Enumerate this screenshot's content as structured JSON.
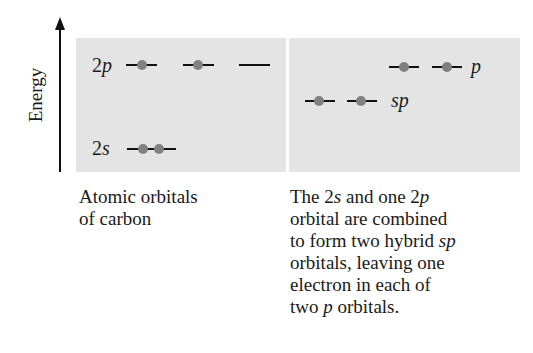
{
  "axis": {
    "label": "Energy"
  },
  "left_panel": {
    "levels": [
      {
        "name": "2p",
        "prefix": "2",
        "italic": "p",
        "orbitals": 3,
        "electrons": [
          1,
          1,
          0
        ]
      },
      {
        "name": "2s",
        "prefix": "2",
        "italic": "s",
        "orbitals": 1,
        "electrons": [
          2
        ]
      }
    ],
    "caption_lines": [
      "Atomic orbitals",
      "of carbon"
    ]
  },
  "right_panel": {
    "levels": [
      {
        "name": "p",
        "italic": "p",
        "orbitals": 2,
        "electrons": [
          1,
          1
        ]
      },
      {
        "name": "sp",
        "italic": "sp",
        "orbitals": 2,
        "electrons": [
          1,
          1
        ]
      }
    ],
    "caption": {
      "line1_a": "The 2",
      "line1_s": "s",
      "line1_b": " and one 2",
      "line1_p": "p",
      "line2": "orbital are combined",
      "line3_a": "to form two hybrid ",
      "line3_sp": "sp",
      "line4": "orbitals, leaving one",
      "line5": "electron in each of",
      "line6_a": "two ",
      "line6_p": "p",
      "line6_b": " orbitals."
    }
  },
  "colors": {
    "panel": "#e4e4e4",
    "electron": "#808080",
    "line": "#111111"
  }
}
